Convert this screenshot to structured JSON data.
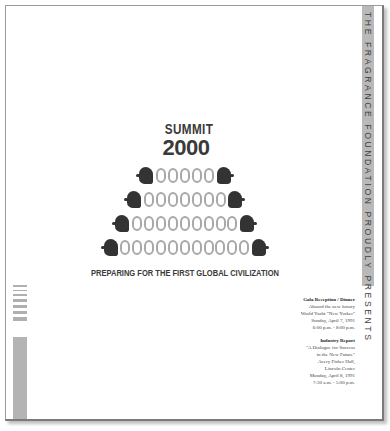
{
  "document": {
    "side_banner": "THE FRAGRANCE FOUNDATION PROUDLY PRESENTS",
    "logo": {
      "title": "SUMMIT",
      "year": "2000",
      "rows": [
        5,
        7,
        9,
        11
      ],
      "digit": "0",
      "tagline": "PREPARING FOR THE FIRST GLOBAL CIVILIZATION"
    },
    "events": [
      {
        "title": "Gala Reception / Dinner",
        "lines": [
          "Aboard the new luxury",
          "World Yacht \"New Yorker\"",
          "Sunday, April 7, 1991",
          "6:00 p.m. - 8:00 p.m."
        ]
      },
      {
        "title": "Industry Report",
        "lines": [
          "\"A Dialogue for Success",
          "in the New Future\"",
          "Avery Fisher Hall,",
          "Lincoln Center",
          "Monday, April 8, 1991",
          "7:30 a.m. - 5:00 p.m."
        ]
      }
    ],
    "colors": {
      "strip": "#b9b9b9",
      "zero": "#a8a8a8",
      "head": "#333333",
      "text": "#3a3a3a"
    }
  }
}
